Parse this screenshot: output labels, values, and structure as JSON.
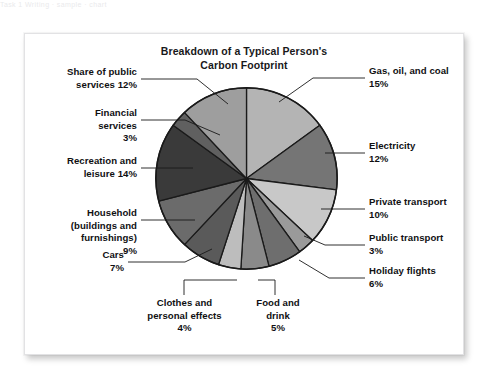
{
  "page": {
    "scan_artifact_text": "Task 1  Writing  ·  sample  ·  chart",
    "background_color": "#ffffff",
    "card_background": "#ffffff",
    "card_border_color": "#e2e2e4"
  },
  "chart_data": {
    "type": "pie",
    "title": "Breakdown of a Typical Person's\nCarbon Footprint",
    "title_line1": "Breakdown of a Typical Person's",
    "title_line2": "Carbon Footprint",
    "xlabel": "",
    "ylabel": "",
    "grid": false,
    "legend_position": "callout-labels",
    "units": "percent",
    "total": 100,
    "start_angle_deg": 0,
    "direction": "clockwise",
    "categories": [
      "Gas, oil, and coal",
      "Electricity",
      "Private transport",
      "Public transport",
      "Holiday flights",
      "Food and drink",
      "Clothes and personal effects",
      "Cars",
      "Household (buildings and furnishings)",
      "Recreation and leisure",
      "Financial services",
      "Share of public services"
    ],
    "values": [
      15,
      12,
      10,
      3,
      6,
      5,
      4,
      7,
      9,
      14,
      3,
      12
    ],
    "colors": [
      "#b4b4b4",
      "#757575",
      "#c8c8c8",
      "#9a9a9a",
      "#6e6e6e",
      "#8a8a8a",
      "#bdbdbd",
      "#5a5a5a",
      "#6b6b6b",
      "#3a3a3a",
      "#606060",
      "#9e9e9e"
    ],
    "slice_stroke": "#1a1a1a",
    "slices": [
      {
        "label": "Gas, oil, and coal",
        "value": 15,
        "color": "#b4b4b4"
      },
      {
        "label": "Electricity",
        "value": 12,
        "color": "#757575"
      },
      {
        "label": "Private transport",
        "value": 10,
        "color": "#c8c8c8"
      },
      {
        "label": "Public transport",
        "value": 3,
        "color": "#9a9a9a"
      },
      {
        "label": "Holiday flights",
        "value": 6,
        "color": "#6e6e6e"
      },
      {
        "label": "Food and drink",
        "value": 5,
        "color": "#8a8a8a"
      },
      {
        "label": "Clothes and personal effects",
        "value": 4,
        "color": "#bdbdbd"
      },
      {
        "label": "Cars",
        "value": 7,
        "color": "#5a5a5a"
      },
      {
        "label": "Household (buildings and furnishings)",
        "value": 9,
        "color": "#6b6b6b"
      },
      {
        "label": "Recreation and leisure",
        "value": 14,
        "color": "#3a3a3a"
      },
      {
        "label": "Financial services",
        "value": 3,
        "color": "#606060"
      },
      {
        "label": "Share of public services",
        "value": 12,
        "color": "#9e9e9e"
      }
    ]
  },
  "labels": {
    "gas_oil_coal": "Gas, oil, and coal\n15%",
    "electricity": "Electricity\n12%",
    "private_transport": "Private transport\n10%",
    "public_transport": "Public transport\n3%",
    "holiday_flights": "Holiday flights\n6%",
    "food_and_drink": "Food and\ndrink\n5%",
    "clothes": "Clothes and\npersonal effects\n4%",
    "cars": "Cars\n7%",
    "household": "Household\n(buildings and\nfurnishings)\n9%",
    "recreation": "Recreation and\nleisure 14%",
    "financial_services": "Financial\nservices\n3%",
    "public_services": "Share of public\nservices 12%"
  }
}
